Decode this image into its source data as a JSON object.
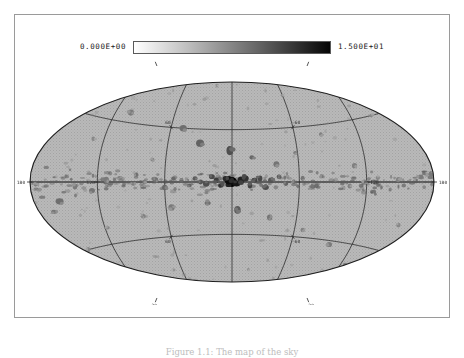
{
  "figure": {
    "projection": "aitoff"
  },
  "colorbar": {
    "min_label": "0.000E+00",
    "max_label": "1.500E+01",
    "orientation": "horizontal",
    "colormap": "grayscale-inverted",
    "low_color": "#ffffff",
    "high_color": "#050505"
  },
  "caption": {
    "text": "Figure 1.1: The map of the sky"
  },
  "chart_data": {
    "type": "scatter",
    "title": "",
    "subtitle": "",
    "projection": "aitoff",
    "coordinate_system": "galactic",
    "xlabel": "",
    "ylabel": "",
    "xlim": [
      180,
      -180
    ],
    "ylim": [
      -90,
      90
    ],
    "grid": true,
    "legend": false,
    "colorbar": {
      "min": 0.0,
      "max": 15.0,
      "min_label": "0.000E+00",
      "max_label": "1.500E+01"
    },
    "longitude_gridlines": [
      -180,
      -120,
      -60,
      0,
      60,
      120,
      180
    ],
    "latitude_gridlines": [
      -60,
      -30,
      0,
      30,
      60
    ],
    "axis_tick_labels": [
      {
        "text": "180",
        "lon": 180,
        "lat": 0,
        "position": "left-edge"
      },
      {
        "text": "180",
        "lon": -180,
        "lat": 0,
        "position": "right-edge"
      },
      {
        "text": "120",
        "lon": 120,
        "lat": 0,
        "position": "inner-left"
      },
      {
        "text": "-120",
        "lon": -120,
        "lat": 0,
        "position": "inner-right"
      },
      {
        "text": "60",
        "lon": 60,
        "lat": 30,
        "position": "edge"
      },
      {
        "text": "-60",
        "lon": -60,
        "lat": 30,
        "position": "edge"
      },
      {
        "text": "60",
        "lon": 60,
        "lat": -30,
        "position": "edge"
      },
      {
        "text": "-60",
        "lon": -60,
        "lat": -30,
        "position": "edge"
      },
      {
        "text": "30",
        "lon": 120,
        "lat": 60,
        "position": "edge"
      },
      {
        "text": "-30",
        "lon": -120,
        "lat": 60,
        "position": "edge"
      },
      {
        "text": "30",
        "lon": 120,
        "lat": -60,
        "position": "edge"
      },
      {
        "text": "-30",
        "lon": -120,
        "lat": -60,
        "position": "edge"
      }
    ],
    "background_level": 2.0,
    "points": [
      {
        "lon": 0,
        "lat": 0,
        "value": 15.0,
        "size": 9
      },
      {
        "lon": 3,
        "lat": 1,
        "value": 14.0,
        "size": 7
      },
      {
        "lon": -4,
        "lat": -1,
        "value": 13.5,
        "size": 6
      },
      {
        "lon": 6,
        "lat": 2,
        "value": 12.0,
        "size": 6
      },
      {
        "lon": -8,
        "lat": 1,
        "value": 12.5,
        "size": 6
      },
      {
        "lon": 10,
        "lat": -2,
        "value": 11.0,
        "size": 5
      },
      {
        "lon": -12,
        "lat": 2,
        "value": 11.5,
        "size": 6
      },
      {
        "lon": 14,
        "lat": 1,
        "value": 10.5,
        "size": 5
      },
      {
        "lon": -16,
        "lat": -2,
        "value": 10.0,
        "size": 5
      },
      {
        "lon": 18,
        "lat": 3,
        "value": 9.5,
        "size": 5
      },
      {
        "lon": -20,
        "lat": 1,
        "value": 10.0,
        "size": 5
      },
      {
        "lon": 23,
        "lat": -1,
        "value": 9.0,
        "size": 5
      },
      {
        "lon": -25,
        "lat": 2,
        "value": 9.5,
        "size": 5
      },
      {
        "lon": 28,
        "lat": 0,
        "value": 8.5,
        "size": 4
      },
      {
        "lon": -30,
        "lat": -3,
        "value": 9.0,
        "size": 5
      },
      {
        "lon": 33,
        "lat": 2,
        "value": 8.0,
        "size": 4
      },
      {
        "lon": -35,
        "lat": 1,
        "value": 8.5,
        "size": 5
      },
      {
        "lon": 38,
        "lat": -2,
        "value": 7.5,
        "size": 4
      },
      {
        "lon": -42,
        "lat": 3,
        "value": 8.0,
        "size": 4
      },
      {
        "lon": 45,
        "lat": 1,
        "value": 7.0,
        "size": 4
      },
      {
        "lon": -48,
        "lat": -1,
        "value": 7.5,
        "size": 4
      },
      {
        "lon": 52,
        "lat": 2,
        "value": 7.0,
        "size": 4
      },
      {
        "lon": -55,
        "lat": 0,
        "value": 6.5,
        "size": 4
      },
      {
        "lon": 60,
        "lat": -3,
        "value": 7.0,
        "size": 5
      },
      {
        "lon": -63,
        "lat": 2,
        "value": 6.0,
        "size": 4
      },
      {
        "lon": 68,
        "lat": 1,
        "value": 6.5,
        "size": 4
      },
      {
        "lon": -72,
        "lat": -2,
        "value": 6.0,
        "size": 4
      },
      {
        "lon": 78,
        "lat": 0,
        "value": 5.5,
        "size": 4
      },
      {
        "lon": -80,
        "lat": 3,
        "value": 6.0,
        "size": 4
      },
      {
        "lon": 88,
        "lat": -1,
        "value": 5.5,
        "size": 4
      },
      {
        "lon": -92,
        "lat": 1,
        "value": 5.0,
        "size": 4
      },
      {
        "lon": 100,
        "lat": 2,
        "value": 5.5,
        "size": 4
      },
      {
        "lon": -105,
        "lat": -2,
        "value": 5.0,
        "size": 4
      },
      {
        "lon": 112,
        "lat": 1,
        "value": 5.5,
        "size": 5
      },
      {
        "lon": -118,
        "lat": 0,
        "value": 5.0,
        "size": 4
      },
      {
        "lon": 125,
        "lat": -4,
        "value": 6.0,
        "size": 5
      },
      {
        "lon": -130,
        "lat": 2,
        "value": 4.5,
        "size": 4
      },
      {
        "lon": 140,
        "lat": -2,
        "value": 5.5,
        "size": 5
      },
      {
        "lon": -148,
        "lat": 1,
        "value": 5.0,
        "size": 4
      },
      {
        "lon": 155,
        "lat": -8,
        "value": 6.5,
        "size": 6
      },
      {
        "lon": 162,
        "lat": -12,
        "value": 6.0,
        "size": 5
      },
      {
        "lon": -168,
        "lat": 2,
        "value": 5.5,
        "size": 5
      },
      {
        "lon": 175,
        "lat": -1,
        "value": 5.0,
        "size": 4
      },
      {
        "lon": -178,
        "lat": 3,
        "value": 5.5,
        "size": 5
      },
      {
        "lon": 2,
        "lat": 18,
        "value": 9.0,
        "size": 7
      },
      {
        "lon": -18,
        "lat": 14,
        "value": 7.0,
        "size": 5
      },
      {
        "lon": 30,
        "lat": 22,
        "value": 7.5,
        "size": 6
      },
      {
        "lon": -40,
        "lat": 10,
        "value": 6.0,
        "size": 5
      },
      {
        "lon": 48,
        "lat": 30,
        "value": 6.5,
        "size": 6
      },
      {
        "lon": -58,
        "lat": 16,
        "value": 5.5,
        "size": 4
      },
      {
        "lon": 72,
        "lat": 12,
        "value": 5.0,
        "size": 4
      },
      {
        "lon": -85,
        "lat": 25,
        "value": 5.0,
        "size": 4
      },
      {
        "lon": 105,
        "lat": 35,
        "value": 5.5,
        "size": 5
      },
      {
        "lon": -110,
        "lat": 8,
        "value": 5.0,
        "size": 4
      },
      {
        "lon": 130,
        "lat": 20,
        "value": 4.5,
        "size": 4
      },
      {
        "lon": -140,
        "lat": 30,
        "value": 4.5,
        "size": 4
      },
      {
        "lon": 150,
        "lat": 45,
        "value": 4.0,
        "size": 3
      },
      {
        "lon": -5,
        "lat": -16,
        "value": 8.0,
        "size": 6
      },
      {
        "lon": 22,
        "lat": -12,
        "value": 6.5,
        "size": 5
      },
      {
        "lon": -35,
        "lat": -20,
        "value": 6.0,
        "size": 5
      },
      {
        "lon": 55,
        "lat": -14,
        "value": 5.5,
        "size": 5
      },
      {
        "lon": -68,
        "lat": -26,
        "value": 5.0,
        "size": 4
      },
      {
        "lon": 82,
        "lat": -18,
        "value": 5.0,
        "size": 4
      },
      {
        "lon": -98,
        "lat": -32,
        "value": 5.5,
        "size": 5
      },
      {
        "lon": 118,
        "lat": -22,
        "value": 4.5,
        "size": 4
      },
      {
        "lon": -125,
        "lat": -40,
        "value": 5.0,
        "size": 4
      },
      {
        "lon": 145,
        "lat": -30,
        "value": 4.5,
        "size": 4
      },
      {
        "lon": -155,
        "lat": -18,
        "value": 4.5,
        "size": 4
      },
      {
        "lon": 100,
        "lat": 52,
        "value": 4.0,
        "size": 3
      },
      {
        "lon": -60,
        "lat": 48,
        "value": 4.0,
        "size": 3
      },
      {
        "lon": 20,
        "lat": 55,
        "value": 3.5,
        "size": 3
      },
      {
        "lon": -20,
        "lat": -50,
        "value": 4.0,
        "size": 3
      },
      {
        "lon": 70,
        "lat": -48,
        "value": 3.5,
        "size": 3
      },
      {
        "lon": -115,
        "lat": 55,
        "value": 3.5,
        "size": 3
      },
      {
        "lon": 160,
        "lat": 25,
        "value": 4.0,
        "size": 3
      },
      {
        "lon": -165,
        "lat": -35,
        "value": 4.0,
        "size": 3
      }
    ]
  }
}
